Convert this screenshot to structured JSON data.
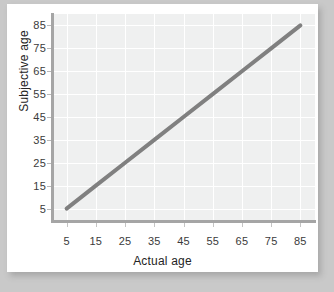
{
  "chart_data": {
    "type": "line",
    "title": "",
    "subtitle": "",
    "xlabel": "Actual age",
    "ylabel": "Subjective age",
    "xlim": [
      0,
      90
    ],
    "ylim": [
      0,
      90
    ],
    "xticks": [
      5,
      15,
      25,
      35,
      45,
      55,
      65,
      75,
      85
    ],
    "yticks": [
      5,
      15,
      25,
      35,
      45,
      55,
      65,
      75,
      85
    ],
    "xtick_labels": [
      "5",
      "15",
      "25",
      "35",
      "45",
      "55",
      "65",
      "75",
      "85"
    ],
    "ytick_labels": [
      "5",
      "15",
      "25",
      "35",
      "45",
      "55",
      "65",
      "75",
      "85"
    ],
    "grid": true,
    "legend": null,
    "annotations": [],
    "series": [
      {
        "name": "identity",
        "color": "#808080",
        "line_width": 4,
        "x": [
          5,
          15,
          25,
          35,
          45,
          55,
          65,
          75,
          85
        ],
        "values": [
          5,
          15,
          25,
          35,
          45,
          55,
          65,
          75,
          85
        ]
      }
    ]
  },
  "style": {
    "page_background": "#c9c9c9",
    "card_background": "#ffffff",
    "plot_background": "#eff0f0",
    "gridline_color": "#ffffff",
    "axis_color": "#a5a5a5",
    "tick_label_color": "#3b3b3b",
    "axis_title_color": "#242424",
    "series_color": "#808080"
  }
}
